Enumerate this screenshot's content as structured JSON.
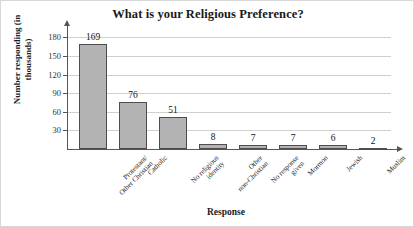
{
  "chart_data": {
    "type": "bar",
    "title": "What is your Religious Preference?",
    "xlabel": "Response",
    "ylabel": "Number responding (in thousands)",
    "ylabel_line1": "Number responding",
    "ylabel_line2": "(in thousands)",
    "categories": [
      "Protestant/ Other Christian",
      "Catholic",
      "No religious identity",
      "Other non-Christian",
      "No response given",
      "Mormon",
      "Jewish",
      "Muslim"
    ],
    "category_lines": [
      [
        "Protestant/",
        "Other Christian"
      ],
      [
        "Catholic"
      ],
      [
        "No religious",
        "identity"
      ],
      [
        "Other",
        "non-Christian"
      ],
      [
        "No response",
        "given"
      ],
      [
        "Mormon"
      ],
      [
        "Jewish"
      ],
      [
        "Muslim"
      ]
    ],
    "values": [
      169,
      76,
      51,
      8,
      7,
      7,
      6,
      2
    ],
    "value_labels": [
      "169",
      "76",
      "51",
      "8",
      "7",
      "7",
      "6",
      "2"
    ],
    "yticks": [
      30,
      60,
      90,
      120,
      150,
      180
    ],
    "ytick_labels": [
      "30",
      "60",
      "90",
      "120",
      "150",
      "180"
    ],
    "ylim": [
      0,
      195
    ],
    "grid": true,
    "legend": false,
    "bar_color": "#b3b3b3",
    "bar_border_color": "#4d4d4d",
    "grid_color": "#cfcfcf",
    "axis_color": "#555555"
  }
}
